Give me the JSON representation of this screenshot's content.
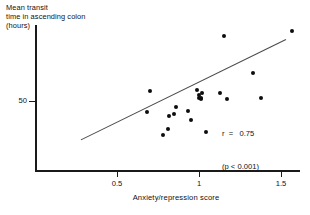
{
  "chart_data": {
    "type": "scatter",
    "title": "",
    "ylabel": "Mean transit\ntime in ascending colon\n(hours)",
    "ylabel_lines": [
      "Mean transit",
      "time in ascending colon",
      "(hours)"
    ],
    "xlabel": "Anxiety/repression score",
    "xlim": [
      0.2,
      1.62
    ],
    "ylim": [
      10,
      100
    ],
    "xticks": [
      0.5,
      1,
      1.5
    ],
    "xticklabels": [
      "0.5",
      "1",
      "1.5"
    ],
    "yticks": [
      50
    ],
    "yticklabels": [
      "50"
    ],
    "grid": false,
    "legend": "none",
    "points": [
      {
        "x": 0.7,
        "y": 56
      },
      {
        "x": 0.68,
        "y": 43
      },
      {
        "x": 0.82,
        "y": 41
      },
      {
        "x": 0.85,
        "y": 42
      },
      {
        "x": 0.86,
        "y": 46
      },
      {
        "x": 0.81,
        "y": 33
      },
      {
        "x": 0.93,
        "y": 44
      },
      {
        "x": 0.99,
        "y": 57
      },
      {
        "x": 1.0,
        "y": 54
      },
      {
        "x": 1.0,
        "y": 52
      },
      {
        "x": 1.01,
        "y": 51
      },
      {
        "x": 1.02,
        "y": 55
      },
      {
        "x": 0.95,
        "y": 38
      },
      {
        "x": 1.04,
        "y": 31
      },
      {
        "x": 1.13,
        "y": 55
      },
      {
        "x": 1.17,
        "y": 51
      },
      {
        "x": 1.01,
        "y": 52
      },
      {
        "x": 1.38,
        "y": 52
      },
      {
        "x": 1.15,
        "y": 90
      },
      {
        "x": 1.57,
        "y": 93
      },
      {
        "x": 1.33,
        "y": 67
      },
      {
        "x": 0.78,
        "y": 29
      }
    ],
    "fit_line": {
      "x_start": 0.28,
      "y_start": 26,
      "x_end": 1.53,
      "y_end": 88
    },
    "annotations": {
      "r_label": "r",
      "r_eq": "=",
      "r_value": "0.75",
      "p_text": "(p < 0.001)",
      "p_italic_var": "p",
      "p_rest": " < 0.001)"
    },
    "stat_lines": [
      "r  =   0.75",
      "(p < 0.001)"
    ]
  },
  "style": {
    "axis_color": "#1a1a1a",
    "point_color": "#0d0d0d",
    "line_color": "#4a4a4a",
    "background": "#ffffff"
  }
}
